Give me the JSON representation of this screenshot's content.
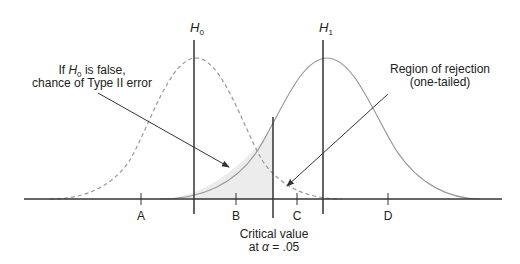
{
  "diagram": {
    "type": "hypothesis-testing-distributions",
    "colors": {
      "axis": "#333333",
      "h0_curve": "#999999",
      "h1_curve": "#999999",
      "shading": "#ececec",
      "text": "#222222"
    },
    "hypotheses": {
      "h0": {
        "symbol": "H",
        "subscript": "0",
        "curve_style": "dashed"
      },
      "h1": {
        "symbol": "H",
        "subscript": "1",
        "curve_style": "solid"
      }
    },
    "annotations": {
      "type2": {
        "line1_prefix": "If ",
        "line1_symbol": "H",
        "line1_sub": "0",
        "line1_suffix": " is false,",
        "line2": "chance of Type II error"
      },
      "rejection": {
        "line1": "Region of rejection",
        "line2": "(one-tailed)"
      },
      "critical": {
        "line1": "Critical value",
        "line2_prefix": "at ",
        "line2_symbol": "α",
        "line2_suffix": " = .05"
      }
    },
    "ticks": [
      {
        "label": "A"
      },
      {
        "label": "B"
      },
      {
        "label": "C"
      },
      {
        "label": "D"
      }
    ]
  }
}
